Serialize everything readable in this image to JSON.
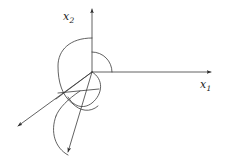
{
  "figure": {
    "type": "vector-diagram",
    "background_color": "#ffffff",
    "stroke_color": "#3a3a3a",
    "stroke_width": 0.8,
    "width": 229,
    "height": 167,
    "origin": {
      "x": 92,
      "y": 72
    }
  },
  "axes": [
    {
      "name": "x2-axis",
      "label_text": "x",
      "label_subscript": "2",
      "direction": "up",
      "start": {
        "x": 92,
        "y": 72
      },
      "tip": {
        "x": 92,
        "y": 6
      },
      "has_arrowhead": true
    },
    {
      "name": "x1-axis",
      "label_text": "x",
      "label_subscript": "1",
      "direction": "right",
      "start": {
        "x": 92,
        "y": 72
      },
      "tip": {
        "x": 216,
        "y": 72
      },
      "has_arrowhead": true
    },
    {
      "name": "x3-axis",
      "label_text": "",
      "label_subscript": "",
      "direction": "down-left",
      "start": {
        "x": 92,
        "y": 72
      },
      "tip": {
        "x": 13,
        "y": 130
      },
      "has_arrowhead": true
    }
  ],
  "rays": [
    {
      "name": "cone-edge-ray",
      "start": {
        "x": 92,
        "y": 72
      },
      "tip": {
        "x": 67,
        "y": 157
      },
      "has_arrowhead": true
    }
  ],
  "arcs": [
    {
      "name": "quadrant-arc-large",
      "description": "large arc from x2 axis sweeping left and down around origin",
      "path": "M 92 38 C 70 38 58 50 58 66 C 58 82 62 95 72 103"
    },
    {
      "name": "quadrant-arc-small",
      "description": "quarter arc in first quadrant between x2 and x1 axes",
      "path": "M 92 52 C 103 52 112 61 112 72"
    },
    {
      "name": "cone-cross-section-left",
      "description": "arc below origin on left side of cone",
      "path": "M 72 103 C 78 110 88 113 97 108"
    },
    {
      "name": "cone-cross-section-inner",
      "description": "inner arc of the cone opening below origin",
      "path": "M 92 72 C 104 78 104 94 92 102 C 82 108 72 104 68 96"
    },
    {
      "name": "cone-lower-arc",
      "description": "lower boundary arc of the elongated cone near the bottom arrow",
      "path": "M 56 114 C 50 130 54 148 67 157"
    },
    {
      "name": "cone-mid-arc",
      "description": "secondary arc of elongated cone",
      "path": "M 78 92 C 66 100 58 110 56 114"
    }
  ],
  "connectors": [
    {
      "name": "chord-left",
      "description": "straight chord connecting left arc to cone region",
      "start": {
        "x": 58,
        "y": 93
      },
      "end": {
        "x": 97,
        "y": 88
      }
    },
    {
      "name": "chord-upper",
      "description": "straight segment from origin region toward lower-left arc",
      "start": {
        "x": 92,
        "y": 72
      },
      "end": {
        "x": 56,
        "y": 99
      }
    }
  ]
}
